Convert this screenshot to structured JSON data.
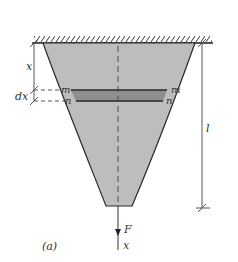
{
  "figure": {
    "caption": "(a)",
    "labels": {
      "x_top": "x",
      "dx": "dx",
      "m_left": "m",
      "m_right": "m",
      "n_left": "n",
      "n_right": "n",
      "length": "l",
      "force": "F",
      "axis": "x"
    },
    "colors": {
      "body_fill": "#bdbdbd",
      "strip_fill": "#8f8f8f",
      "outline": "#2a2a2a",
      "dimension": "#444444"
    }
  }
}
